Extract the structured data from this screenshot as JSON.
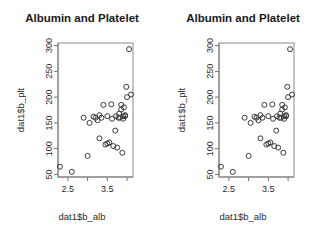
{
  "figure": {
    "background_color": "#ffffff",
    "point_color": "#3a3a3a",
    "frame_color": "#8a8a8a",
    "panel_count": 2
  },
  "panels": [
    {
      "id": "panel-left",
      "title": "Albumin and Platelet"
    },
    {
      "id": "panel-right",
      "title": "Albumin and Platelet"
    }
  ],
  "chart_data": {
    "type": "scatter",
    "title": "Albumin and Platelet",
    "xlabel": "dat1$b_alb",
    "ylabel": "dat1$b_plt",
    "xlim": [
      2.25,
      4.15
    ],
    "ylim": [
      45,
      305
    ],
    "grid": false,
    "legend": null,
    "marker": "open-circle",
    "xticks": [
      2.5,
      3.0,
      3.5,
      4.0
    ],
    "xtick_labels": [
      "2.5",
      "",
      "3.5",
      ""
    ],
    "yticks": [
      50,
      100,
      150,
      200,
      250,
      300
    ],
    "ytick_labels": [
      "50",
      "100",
      "150",
      "200",
      "250",
      "300"
    ],
    "x": [
      2.3,
      2.6,
      2.9,
      3.0,
      3.05,
      3.15,
      3.2,
      3.25,
      3.3,
      3.3,
      3.35,
      3.4,
      3.45,
      3.5,
      3.5,
      3.55,
      3.6,
      3.62,
      3.65,
      3.7,
      3.72,
      3.75,
      3.78,
      3.8,
      3.82,
      3.85,
      3.85,
      3.88,
      3.9,
      3.9,
      3.92,
      3.95,
      3.95,
      3.98,
      4.0,
      4.05,
      4.1
    ],
    "y": [
      65,
      55,
      160,
      86,
      150,
      162,
      160,
      155,
      120,
      165,
      160,
      185,
      108,
      163,
      110,
      112,
      186,
      158,
      105,
      135,
      163,
      102,
      160,
      168,
      160,
      185,
      176,
      92,
      163,
      158,
      180,
      165,
      163,
      220,
      200,
      293,
      205
    ],
    "series": [
      {
        "name": "dat1",
        "points": [
          [
            2.3,
            65
          ],
          [
            2.6,
            55
          ],
          [
            2.9,
            160
          ],
          [
            3.0,
            86
          ],
          [
            3.05,
            150
          ],
          [
            3.15,
            162
          ],
          [
            3.2,
            160
          ],
          [
            3.25,
            155
          ],
          [
            3.3,
            120
          ],
          [
            3.3,
            165
          ],
          [
            3.35,
            160
          ],
          [
            3.4,
            185
          ],
          [
            3.45,
            108
          ],
          [
            3.5,
            163
          ],
          [
            3.5,
            110
          ],
          [
            3.55,
            112
          ],
          [
            3.6,
            186
          ],
          [
            3.62,
            158
          ],
          [
            3.65,
            105
          ],
          [
            3.7,
            135
          ],
          [
            3.72,
            163
          ],
          [
            3.75,
            102
          ],
          [
            3.78,
            160
          ],
          [
            3.8,
            168
          ],
          [
            3.82,
            160
          ],
          [
            3.85,
            185
          ],
          [
            3.85,
            176
          ],
          [
            3.88,
            92
          ],
          [
            3.9,
            163
          ],
          [
            3.9,
            158
          ],
          [
            3.92,
            180
          ],
          [
            3.95,
            165
          ],
          [
            3.95,
            163
          ],
          [
            3.98,
            220
          ],
          [
            4.0,
            200
          ],
          [
            4.05,
            293
          ],
          [
            4.1,
            205
          ]
        ]
      }
    ],
    "n_points": 37
  }
}
